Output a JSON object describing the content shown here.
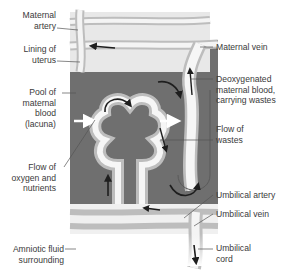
{
  "diagram": {
    "colors": {
      "pool": "#6f6f6f",
      "uterus": "#e6e6e6",
      "vessel_wall": "#b8b8b8",
      "vessel_light": "#f2f2f2",
      "arrow": "#1e1e1e"
    },
    "labels_left": [
      {
        "id": "maternal-artery",
        "lines": [
          "Maternal",
          "artery"
        ]
      },
      {
        "id": "lining-of-uterus",
        "lines": [
          "Lining of",
          "uterus"
        ]
      },
      {
        "id": "pool-maternal-blood",
        "lines": [
          "Pool of",
          "maternal",
          "blood",
          "(lacuna)"
        ]
      },
      {
        "id": "flow-oxygen-nutrients",
        "lines": [
          "Flow of",
          "oxygen and",
          "nutrients"
        ]
      },
      {
        "id": "amniotic-fluid",
        "lines": [
          "Amniotic fluid",
          "surrounding"
        ]
      }
    ],
    "labels_right": [
      {
        "id": "maternal-vein",
        "lines": [
          "Maternal vein"
        ]
      },
      {
        "id": "deoxygenated-blood",
        "lines": [
          "Deoxygenated",
          "maternal blood,",
          "carrying wastes"
        ]
      },
      {
        "id": "flow-of-wastes",
        "lines": [
          "Flow of",
          "wastes"
        ]
      },
      {
        "id": "umbilical-artery",
        "lines": [
          "Umbilical artery"
        ]
      },
      {
        "id": "umbilical-vein",
        "lines": [
          "Umbilical vein"
        ]
      },
      {
        "id": "umbilical-cord",
        "lines": [
          "Umbilical",
          "cord"
        ]
      }
    ]
  }
}
